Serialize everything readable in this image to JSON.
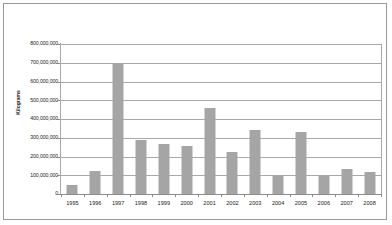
{
  "chart_data": {
    "type": "bar",
    "title": "",
    "xlabel": "",
    "ylabel": "Kilograms",
    "categories": [
      "1995",
      "1996",
      "1997",
      "1998",
      "1999",
      "2000",
      "2001",
      "2002",
      "2003",
      "2004",
      "2005",
      "2006",
      "2007",
      "2008"
    ],
    "values": [
      50000000,
      125000000,
      700000000,
      290000000,
      265000000,
      255000000,
      460000000,
      225000000,
      340000000,
      95000000,
      330000000,
      95000000,
      135000000,
      120000000
    ],
    "series": [
      {
        "name": "Kilograms",
        "values": [
          50000000,
          125000000,
          700000000,
          290000000,
          265000000,
          255000000,
          460000000,
          225000000,
          340000000,
          95000000,
          330000000,
          95000000,
          135000000,
          120000000
        ]
      }
    ],
    "ylim": [
      0,
      800000000
    ],
    "ytick_values": [
      0,
      100000000,
      200000000,
      300000000,
      400000000,
      500000000,
      600000000,
      700000000,
      800000000
    ],
    "ytick_labels": [
      "0",
      "100,000,000",
      "200,000,000",
      "300,000,000",
      "400,000,000",
      "500,000,000",
      "600,000,000",
      "700,000,000",
      "800,000,000"
    ],
    "grid": true,
    "legend": "none",
    "bar_color": "#a5a5a5",
    "grid_color": "#a9a9a9",
    "axis_color": "#8c8c8c",
    "border_color": "#9a9a9a",
    "background": "#ffffff"
  }
}
